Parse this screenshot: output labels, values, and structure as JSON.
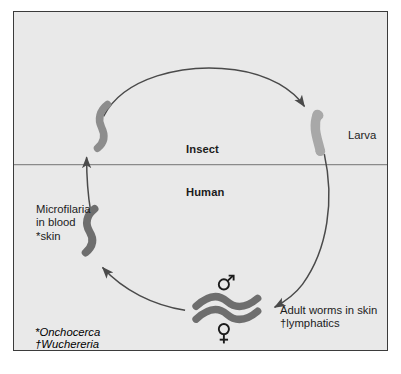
{
  "figure": {
    "panel": {
      "background_color": "#e9e9e9",
      "border_color": "#3b3b3b"
    },
    "divider": {
      "name": "insect-human-divider",
      "color": "#8a8a8a"
    },
    "zones": {
      "upper_label": "Insect",
      "lower_label": "Human"
    },
    "stages": {
      "larva": {
        "label": "Larva",
        "shape_color": "#a8a8a8",
        "outline_color": "#8d8d8d"
      },
      "adult_worms": {
        "label": "Adult worms in skin\n†lymphatics",
        "male_symbol": "♂",
        "female_symbol": "♀",
        "shape_color": "#6e6e6e"
      },
      "microfilaria": {
        "label": "Microfilaria\nin blood\n*skin",
        "shape_color": "#6e6e6e"
      },
      "insect_microfilaria": {
        "shape_color": "#8d8d8d"
      }
    },
    "arrows": {
      "color": "#4a4a4a",
      "top_arc_name": "arrow-insect-to-larva",
      "right_arc_name": "arrow-larva-to-adult",
      "bottom_arc_name": "arrow-adult-to-microfilaria",
      "left_short_name": "arrow-microfilaria-to-insect"
    },
    "legend": {
      "line1": "*Onchocerca",
      "line2": "†Wuchereria"
    },
    "caption": ""
  }
}
